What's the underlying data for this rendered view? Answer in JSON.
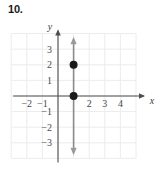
{
  "problem": {
    "number": "10."
  },
  "chart_data": {
    "type": "scatter",
    "title": "",
    "xlabel": "x",
    "ylabel": "y",
    "xlim": [
      -3,
      5
    ],
    "ylim": [
      -4,
      4
    ],
    "grid": true,
    "legend": null,
    "x_tick_labels": [
      "−2",
      "−1",
      "2",
      "3",
      "4"
    ],
    "x_tick_values": [
      -2,
      -1,
      2,
      3,
      4
    ],
    "y_tick_labels": [
      "3",
      "2",
      "1",
      "−1",
      "−2",
      "−3"
    ],
    "y_tick_values": [
      3,
      2,
      1,
      -1,
      -2,
      -3
    ],
    "points": [
      {
        "x": 1,
        "y": 0,
        "style": "filled"
      },
      {
        "x": 1,
        "y": 2,
        "style": "filled"
      }
    ],
    "lines": [
      {
        "kind": "vertical",
        "equation": "x = 1",
        "x": 1,
        "from_y": -3.6,
        "to_y": 3.6,
        "arrows": "both",
        "color": "#8a8a8a"
      }
    ],
    "axis_color": "#4d4d4d",
    "grid_color": "#ececec",
    "point_color": "#1a1a1a",
    "background": "#ffffff"
  }
}
